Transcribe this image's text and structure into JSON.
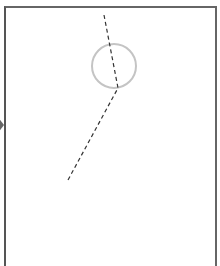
{
  "canvas": {
    "frame_color": "#5a5a5a",
    "circle": {
      "cx": 114,
      "cy": 66,
      "r": 22,
      "stroke": "#c4c4c4"
    },
    "dashed_path": {
      "points": [
        [
          104,
          15
        ],
        [
          118,
          88
        ],
        [
          68,
          180
        ]
      ],
      "stroke": "#333333"
    },
    "handle_color": "#666666"
  }
}
